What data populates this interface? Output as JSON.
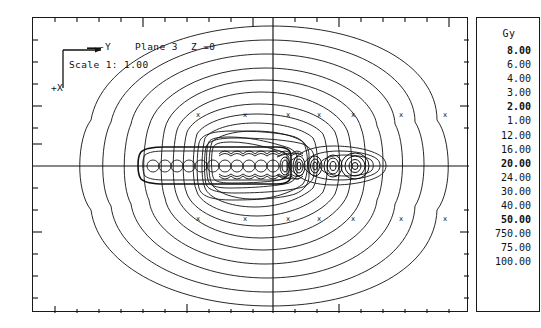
{
  "annotation": {
    "axis_y_label": "-Y",
    "axis_x_label": "+X",
    "plane_label": "Plane 3",
    "z_label": "Z =0",
    "scale_label": "Scale 1: 1.00"
  },
  "legend": {
    "unit": "Gy",
    "levels": [
      {
        "value": "8.00",
        "bold": true
      },
      {
        "value": "6.00",
        "bold": false
      },
      {
        "value": "4.00",
        "bold": false
      },
      {
        "value": "3.00",
        "bold": false
      },
      {
        "value": "2.00",
        "bold": true
      },
      {
        "value": "1.00",
        "bold": false
      },
      {
        "value": "12.00",
        "bold": false
      },
      {
        "value": "16.00",
        "bold": false
      },
      {
        "value": "20.00",
        "bold": true
      },
      {
        "value": "24.00",
        "bold": false
      },
      {
        "value": "30.00",
        "bold": false
      },
      {
        "value": "40.00",
        "bold": false
      },
      {
        "value": "50.00",
        "bold": true
      },
      {
        "value": "750.00",
        "bold": false
      },
      {
        "value": "75.00",
        "bold": false
      },
      {
        "value": "100.00",
        "bold": false
      }
    ]
  },
  "colors": {
    "ink": "#1a1a1a",
    "background": "#ffffff",
    "contour": "#111111"
  },
  "chart_data": {
    "type": "line",
    "title": "Plane 3  Z =0",
    "xlabel": "+X",
    "ylabel": "-Y",
    "unit": "Gy",
    "grid": false,
    "legend_position": "right",
    "axis_origin_px": {
      "x": 240,
      "y": 148
    },
    "xlim": [
      -240,
      196
    ],
    "ylim": [
      -148,
      147
    ],
    "tick_spacing_minor": 22,
    "tick_spacing_major": 110,
    "contour_levels": [
      1.0,
      2.0,
      3.0,
      4.0,
      6.0,
      8.0,
      12.0,
      16.0,
      20.0,
      24.0,
      30.0,
      40.0,
      50.0,
      75.0,
      100.0,
      750.0
    ],
    "series": [
      {
        "name": "linear-source-train",
        "x_start": -130,
        "x_end": -10,
        "y": 0,
        "n_elements": 12
      },
      {
        "name": "discrete-seeds",
        "x_start": 10,
        "x_end": 118,
        "y": 0,
        "n_elements": 6
      }
    ],
    "contour_markers": {
      "glyph": "x",
      "upper_row_y": -52,
      "lower_row_y": 52,
      "x_positions": [
        -75,
        -28,
        15,
        46,
        80,
        128,
        172
      ]
    }
  }
}
